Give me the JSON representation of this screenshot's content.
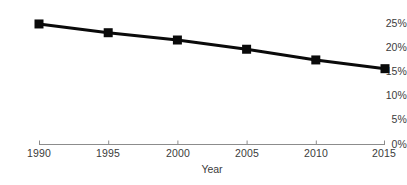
{
  "chart_data": {
    "type": "line",
    "title": "",
    "subtitle": "",
    "xlabel": "Year",
    "ylabel": "",
    "x": [
      1990,
      1995,
      2000,
      2005,
      2010,
      2015
    ],
    "categories": [
      "1990",
      "1995",
      "2000",
      "2005",
      "2010",
      "2015"
    ],
    "values": [
      24.8,
      23.0,
      21.5,
      19.6,
      17.4,
      15.6
    ],
    "series": [
      {
        "name": "",
        "values": [
          24.8,
          23.0,
          21.5,
          19.6,
          17.4,
          15.6
        ]
      }
    ],
    "xtick_labels": [
      "1990",
      "1995",
      "2000",
      "2005",
      "2010",
      "2015"
    ],
    "ytick_labels": [
      "0%",
      "5%",
      "10%",
      "15%",
      "20%",
      "25%"
    ],
    "ytick_values": [
      0,
      5,
      10,
      15,
      20,
      25
    ],
    "xlim": [
      1990,
      2015
    ],
    "ylim": [
      0,
      25
    ],
    "grid": false,
    "legend": false,
    "legend_position": "none",
    "annotations": [],
    "line_color": "#0a0a0a",
    "marker_color": "#0a0a0a",
    "marker_shape": "square",
    "axis_color": "#8c8c8c",
    "text_color": "#3b3b3b",
    "background_color": "#ffffff"
  }
}
